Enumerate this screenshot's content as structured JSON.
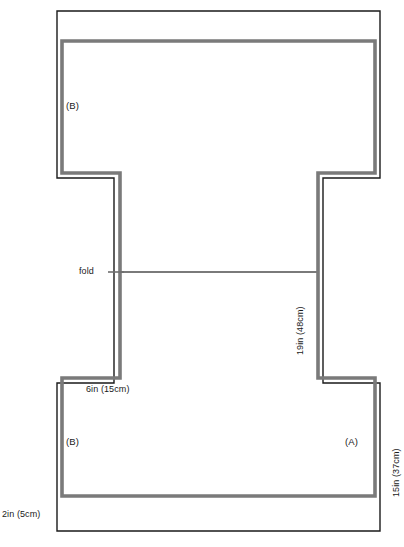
{
  "diagram": {
    "colors": {
      "cut_line": "#1a1a1a",
      "seam_line": "#7a7a7a",
      "background": "#ffffff",
      "text": "#1a1a1a"
    },
    "labels": {
      "fold": "fold",
      "piece_b_upper": "(B)",
      "piece_b_lower": "(B)",
      "piece_a": "(A)",
      "shoulder_width": "6in (15cm)",
      "sleeve_depth": "19in (48cm)",
      "body_length": "15in (37cm)",
      "hem_allowance": "2in (5cm)"
    },
    "icons": {
      "fold_leader": "fold-leader-line"
    }
  }
}
